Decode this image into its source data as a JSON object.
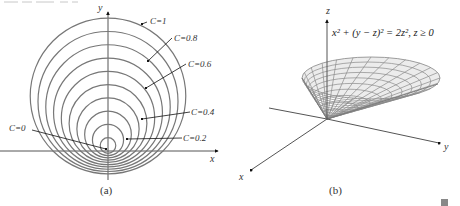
{
  "figure": {
    "panels": [
      {
        "id": "a",
        "caption": "(a)",
        "axes": {
          "x_label": "x",
          "y_label": "y"
        },
        "curve_labels": [
          {
            "text": "C=1",
            "C": 1.0
          },
          {
            "text": "C=0.8",
            "C": 0.8
          },
          {
            "text": "C=0.6",
            "C": 0.6
          },
          {
            "text": "C=0.4",
            "C": 0.4
          },
          {
            "text": "C=0.2",
            "C": 0.2
          },
          {
            "text": "C=0",
            "C": 0.0
          }
        ],
        "level_values": [
          0.1,
          0.2,
          0.3,
          0.4,
          0.5,
          0.6,
          0.7,
          0.8,
          0.9,
          1.0
        ]
      },
      {
        "id": "b",
        "caption": "(b)",
        "axes": {
          "x_label": "x",
          "y_label": "y",
          "z_label": "z"
        },
        "equation": "x² + (y − z)² = 2z²,  z ≥ 0"
      }
    ]
  },
  "chart_data": [
    {
      "type": "line",
      "title": "Level curves (a)",
      "xlabel": "x",
      "ylabel": "y",
      "description": "Family of nested circles, one per level value C; all circles grow from the origin, with C=0 the degenerate point at the origin",
      "series": [
        {
          "name": "C=0.1",
          "C": 0.1
        },
        {
          "name": "C=0.2",
          "C": 0.2
        },
        {
          "name": "C=0.3",
          "C": 0.3
        },
        {
          "name": "C=0.4",
          "C": 0.4
        },
        {
          "name": "C=0.5",
          "C": 0.5
        },
        {
          "name": "C=0.6",
          "C": 0.6
        },
        {
          "name": "C=0.7",
          "C": 0.7
        },
        {
          "name": "C=0.8",
          "C": 0.8
        },
        {
          "name": "C=0.9",
          "C": 0.9
        },
        {
          "name": "C=1",
          "C": 1.0
        }
      ],
      "annotations": [
        "C=1",
        "C=0.8",
        "C=0.6",
        "C=0.4",
        "C=0.2",
        "C=0"
      ],
      "grid": false
    },
    {
      "type": "surface",
      "title": "x² + (y − z)² = 2z², z ≥ 0",
      "xlabel": "x",
      "ylabel": "y",
      "zlabel": "z",
      "description": "Oblique elliptic cone with vertex at origin, opening upward, shown as a gridded surface"
    }
  ]
}
